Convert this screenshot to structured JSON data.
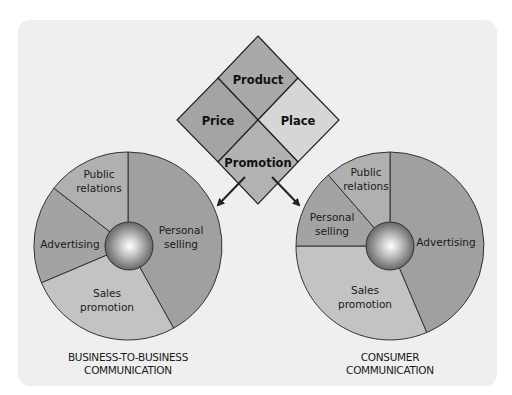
{
  "marketing_mix": {
    "product": "Product",
    "price": "Price",
    "place": "Place",
    "promotion": "Promotion",
    "colors": {
      "product": "#a9a9a9",
      "price": "#a4a4a4",
      "place": "#d6d6d6",
      "promotion": "#b2b2b2"
    }
  },
  "b2b_pie": {
    "caption_line1": "BUSINESS-TO-BUSINESS",
    "caption_line2": "COMMUNICATION",
    "slices": [
      {
        "label_line1": "Personal",
        "label_line2": "selling",
        "share_pct": 42,
        "color": "#a0a0a0"
      },
      {
        "label_line1": "Sales",
        "label_line2": "promotion",
        "share_pct": 27,
        "color": "#c3c3c3"
      },
      {
        "label_line1": "Advertising",
        "label_line2": "",
        "share_pct": 17,
        "color": "#a3a3a3"
      },
      {
        "label_line1": "Public",
        "label_line2": "relations",
        "share_pct": 14,
        "color": "#b0b0b0"
      }
    ]
  },
  "consumer_pie": {
    "caption_line1": "CONSUMER",
    "caption_line2": "COMMUNICATION",
    "slices": [
      {
        "label_line1": "Advertising",
        "label_line2": "",
        "share_pct": 44,
        "color": "#a0a0a0"
      },
      {
        "label_line1": "Sales",
        "label_line2": "promotion",
        "share_pct": 31,
        "color": "#c3c3c3"
      },
      {
        "label_line1": "Personal",
        "label_line2": "selling",
        "share_pct": 14,
        "color": "#a3a3a3"
      },
      {
        "label_line1": "Public",
        "label_line2": "relations",
        "share_pct": 11,
        "color": "#b0b0b0"
      }
    ]
  },
  "colors": {
    "panel": "#efefef",
    "outline": "#333333",
    "arrow": "#222222"
  }
}
